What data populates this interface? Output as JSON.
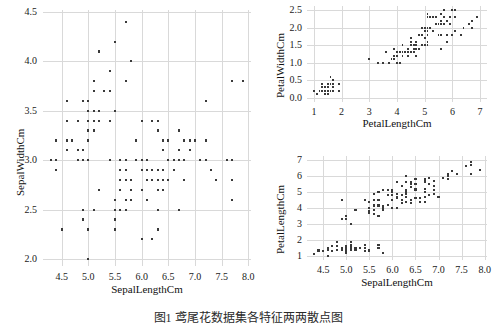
{
  "figure": {
    "caption": "图1 鸢尾花数据集各特征两两散点图",
    "marker_color": "#3a3a3a",
    "grid_color": "#d9d9d9",
    "background": "#ffffff"
  },
  "chart_data": [
    {
      "id": "sepal-width-vs-sepal-length",
      "type": "scatter",
      "title": "",
      "xlabel": "SepalLengthCm",
      "ylabel": "SepalWidthCm",
      "xlim": [
        4.15,
        8.05
      ],
      "ylim": [
        1.93,
        4.52
      ],
      "xticks": [
        "4.5",
        "5.0",
        "5.5",
        "6.0",
        "6.5",
        "7.0",
        "7.5",
        "8.0"
      ],
      "xtickvals": [
        4.5,
        5.0,
        5.5,
        6.0,
        6.5,
        7.0,
        7.5,
        8.0
      ],
      "yticks": [
        "2.0",
        "2.5",
        "3.0",
        "3.5",
        "4.0",
        "4.5"
      ],
      "ytickvals": [
        2.0,
        2.5,
        3.0,
        3.5,
        4.0,
        4.5
      ],
      "grid": true,
      "legend": "none",
      "x": [
        5.1,
        4.9,
        4.7,
        4.6,
        5.0,
        5.4,
        4.6,
        5.0,
        4.4,
        4.9,
        5.4,
        4.8,
        4.8,
        4.3,
        5.8,
        5.7,
        5.4,
        5.1,
        5.7,
        5.1,
        5.4,
        5.1,
        4.6,
        5.1,
        4.8,
        5.0,
        5.0,
        5.2,
        5.2,
        4.7,
        4.8,
        5.4,
        5.2,
        5.5,
        4.9,
        5.0,
        5.5,
        4.9,
        4.4,
        5.1,
        5.0,
        4.5,
        4.4,
        5.0,
        5.1,
        4.8,
        5.1,
        4.6,
        5.3,
        5.0,
        7.0,
        6.4,
        6.9,
        5.5,
        6.5,
        5.7,
        6.3,
        4.9,
        6.6,
        5.2,
        5.0,
        5.9,
        6.0,
        6.1,
        5.6,
        6.7,
        5.6,
        5.8,
        6.2,
        5.6,
        5.9,
        6.1,
        6.3,
        6.1,
        6.4,
        6.6,
        6.8,
        6.7,
        6.0,
        5.7,
        5.5,
        5.5,
        5.8,
        6.0,
        5.4,
        6.0,
        6.7,
        6.3,
        5.6,
        5.5,
        5.5,
        6.1,
        5.8,
        5.0,
        5.6,
        5.7,
        5.7,
        6.2,
        5.1,
        5.7,
        6.3,
        5.8,
        7.1,
        6.3,
        6.5,
        7.6,
        4.9,
        7.3,
        6.7,
        7.2,
        6.5,
        6.4,
        6.8,
        5.7,
        5.8,
        6.4,
        6.5,
        7.7,
        7.7,
        6.0,
        6.9,
        5.6,
        7.7,
        6.3,
        6.7,
        7.2,
        6.2,
        6.1,
        6.4,
        7.2,
        7.4,
        7.9,
        6.4,
        6.3,
        6.1,
        7.7,
        6.3,
        6.4,
        6.0,
        6.9,
        6.7,
        6.9,
        5.8,
        6.8,
        6.7,
        6.7,
        6.3,
        6.5,
        6.2,
        5.9
      ],
      "y": [
        3.5,
        3.0,
        3.2,
        3.1,
        3.6,
        3.9,
        3.4,
        3.4,
        2.9,
        3.1,
        3.7,
        3.4,
        3.0,
        3.0,
        4.0,
        4.4,
        3.9,
        3.5,
        3.8,
        3.8,
        3.4,
        3.7,
        3.6,
        3.3,
        3.4,
        3.0,
        3.4,
        3.5,
        3.4,
        3.2,
        3.1,
        3.4,
        4.1,
        4.2,
        3.1,
        3.2,
        3.5,
        3.6,
        3.0,
        3.4,
        3.5,
        2.3,
        3.2,
        3.5,
        3.8,
        3.0,
        3.8,
        3.2,
        3.7,
        3.3,
        3.2,
        3.2,
        3.1,
        2.3,
        2.8,
        2.8,
        3.3,
        2.4,
        2.9,
        2.7,
        2.0,
        3.0,
        2.2,
        2.9,
        2.9,
        3.1,
        3.0,
        2.7,
        2.2,
        2.5,
        3.2,
        2.8,
        2.5,
        2.8,
        2.9,
        3.0,
        2.8,
        3.0,
        2.9,
        2.6,
        2.4,
        2.4,
        2.7,
        2.7,
        3.0,
        3.4,
        3.1,
        2.3,
        3.0,
        2.5,
        2.6,
        3.0,
        2.6,
        2.3,
        2.7,
        3.0,
        2.9,
        2.9,
        2.5,
        2.8,
        3.3,
        2.7,
        3.0,
        2.9,
        3.0,
        3.0,
        2.5,
        2.9,
        2.5,
        3.6,
        3.2,
        2.7,
        3.0,
        2.5,
        2.8,
        3.2,
        3.0,
        3.8,
        2.6,
        2.2,
        3.2,
        2.8,
        2.8,
        2.7,
        3.3,
        3.2,
        2.8,
        3.0,
        2.8,
        3.0,
        2.8,
        3.8,
        2.8,
        2.8,
        2.6,
        3.0,
        3.4,
        3.1,
        3.0,
        3.1,
        3.1,
        3.1,
        2.7,
        3.2,
        3.3,
        3.0,
        2.5,
        3.0,
        3.4,
        3.0
      ]
    },
    {
      "id": "petal-width-vs-petal-length",
      "type": "scatter",
      "title": "",
      "xlabel": "PetalLengthCm",
      "ylabel": "PetalWidthCm",
      "xlim": [
        0.75,
        7.25
      ],
      "ylim": [
        -0.12,
        2.62
      ],
      "xticks": [
        "1",
        "2",
        "3",
        "4",
        "5",
        "6",
        "7"
      ],
      "xtickvals": [
        1,
        2,
        3,
        4,
        5,
        6,
        7
      ],
      "yticks": [
        "0.0",
        "0.5",
        "1.0",
        "1.5",
        "2.0",
        "2.5"
      ],
      "ytickvals": [
        0.0,
        0.5,
        1.0,
        1.5,
        2.0,
        2.5
      ],
      "grid": true,
      "legend": "none",
      "x": [
        1.4,
        1.4,
        1.3,
        1.5,
        1.4,
        1.7,
        1.4,
        1.5,
        1.4,
        1.5,
        1.5,
        1.6,
        1.4,
        1.1,
        1.2,
        1.5,
        1.3,
        1.4,
        1.7,
        1.5,
        1.7,
        1.5,
        1.0,
        1.7,
        1.9,
        1.6,
        1.6,
        1.5,
        1.4,
        1.6,
        1.6,
        1.5,
        1.5,
        1.4,
        1.5,
        1.2,
        1.3,
        1.4,
        1.3,
        1.5,
        1.3,
        1.3,
        1.3,
        1.6,
        1.9,
        1.4,
        1.6,
        1.4,
        1.5,
        1.4,
        4.7,
        4.5,
        4.9,
        4.0,
        4.6,
        4.5,
        4.7,
        3.3,
        4.6,
        3.9,
        3.5,
        4.2,
        4.0,
        4.7,
        3.6,
        4.4,
        4.5,
        4.1,
        4.5,
        3.9,
        4.8,
        4.0,
        4.9,
        4.7,
        4.3,
        4.4,
        4.8,
        5.0,
        4.5,
        3.5,
        3.8,
        3.7,
        3.9,
        5.1,
        4.5,
        4.5,
        4.7,
        4.4,
        4.1,
        4.0,
        4.4,
        4.6,
        4.0,
        3.3,
        4.2,
        4.2,
        4.2,
        4.3,
        3.0,
        4.1,
        6.0,
        5.1,
        5.9,
        5.6,
        5.8,
        6.6,
        4.5,
        6.3,
        5.8,
        6.1,
        5.1,
        5.3,
        5.5,
        5.0,
        5.1,
        5.3,
        5.5,
        6.7,
        6.9,
        5.0,
        5.7,
        4.9,
        6.7,
        4.9,
        5.7,
        6.0,
        4.8,
        4.9,
        5.6,
        5.8,
        6.1,
        6.4,
        5.6,
        5.1,
        5.6,
        6.1,
        5.6,
        5.5,
        4.8,
        5.4,
        5.6,
        5.1,
        5.1,
        5.9,
        5.7,
        5.2,
        5.0,
        5.2,
        5.4,
        5.1
      ],
      "y": [
        0.2,
        0.2,
        0.2,
        0.2,
        0.2,
        0.4,
        0.3,
        0.2,
        0.2,
        0.1,
        0.2,
        0.2,
        0.1,
        0.1,
        0.2,
        0.4,
        0.4,
        0.3,
        0.3,
        0.3,
        0.2,
        0.4,
        0.2,
        0.5,
        0.2,
        0.2,
        0.4,
        0.2,
        0.2,
        0.2,
        0.2,
        0.4,
        0.1,
        0.2,
        0.2,
        0.2,
        0.2,
        0.1,
        0.2,
        0.2,
        0.3,
        0.3,
        0.2,
        0.6,
        0.4,
        0.3,
        0.2,
        0.2,
        0.2,
        0.2,
        1.4,
        1.5,
        1.5,
        1.3,
        1.5,
        1.3,
        1.6,
        1.0,
        1.3,
        1.4,
        1.0,
        1.5,
        1.0,
        1.4,
        1.3,
        1.4,
        1.5,
        1.0,
        1.5,
        1.1,
        1.8,
        1.3,
        1.5,
        1.2,
        1.3,
        1.4,
        1.4,
        1.7,
        1.5,
        1.0,
        1.1,
        1.0,
        1.2,
        1.6,
        1.5,
        1.6,
        1.5,
        1.3,
        1.3,
        1.3,
        1.2,
        1.4,
        1.2,
        1.0,
        1.3,
        1.2,
        1.3,
        1.3,
        1.1,
        1.3,
        2.5,
        1.9,
        2.1,
        1.8,
        2.2,
        2.1,
        1.7,
        1.8,
        1.8,
        2.5,
        2.0,
        1.9,
        2.1,
        2.0,
        2.4,
        2.3,
        1.8,
        2.2,
        2.3,
        1.5,
        2.3,
        2.0,
        2.0,
        1.8,
        2.1,
        1.8,
        1.8,
        1.8,
        2.1,
        1.6,
        1.9,
        2.0,
        2.2,
        1.5,
        1.4,
        2.3,
        2.4,
        1.8,
        1.8,
        2.1,
        2.4,
        2.3,
        1.9,
        2.3,
        2.5,
        2.3,
        1.9,
        2.0,
        2.3,
        1.8
      ]
    },
    {
      "id": "petal-length-vs-sepal-length",
      "type": "scatter",
      "title": "",
      "xlabel": "SepalLengthCm",
      "ylabel": "PetalLengthCm",
      "xlim": [
        4.15,
        8.05
      ],
      "ylim": [
        0.75,
        7.25
      ],
      "xticks": [
        "4.5",
        "5.0",
        "5.5",
        "6.0",
        "6.5",
        "7.0",
        "7.5",
        "8.0"
      ],
      "xtickvals": [
        4.5,
        5.0,
        5.5,
        6.0,
        6.5,
        7.0,
        7.5,
        8.0
      ],
      "yticks": [
        "1",
        "2",
        "3",
        "4",
        "5",
        "6",
        "7"
      ],
      "ytickvals": [
        1,
        2,
        3,
        4,
        5,
        6,
        7
      ],
      "grid": true,
      "legend": "none",
      "x": [
        5.1,
        4.9,
        4.7,
        4.6,
        5.0,
        5.4,
        4.6,
        5.0,
        4.4,
        4.9,
        5.4,
        4.8,
        4.8,
        4.3,
        5.8,
        5.7,
        5.4,
        5.1,
        5.7,
        5.1,
        5.4,
        5.1,
        4.6,
        5.1,
        4.8,
        5.0,
        5.0,
        5.2,
        5.2,
        4.7,
        4.8,
        5.4,
        5.2,
        5.5,
        4.9,
        5.0,
        5.5,
        4.9,
        4.4,
        5.1,
        5.0,
        4.5,
        4.4,
        5.0,
        5.1,
        4.8,
        5.1,
        4.6,
        5.3,
        5.0,
        7.0,
        6.4,
        6.9,
        5.5,
        6.5,
        5.7,
        6.3,
        4.9,
        6.6,
        5.2,
        5.0,
        5.9,
        6.0,
        6.1,
        5.6,
        6.7,
        5.6,
        5.8,
        6.2,
        5.6,
        5.9,
        6.1,
        6.3,
        6.1,
        6.4,
        6.6,
        6.8,
        6.7,
        6.0,
        5.7,
        5.5,
        5.5,
        5.8,
        6.0,
        5.4,
        6.0,
        6.7,
        6.3,
        5.6,
        5.5,
        5.5,
        6.1,
        5.8,
        5.0,
        5.6,
        5.7,
        5.7,
        6.2,
        5.1,
        5.7,
        6.3,
        5.8,
        7.1,
        6.3,
        6.5,
        7.6,
        4.9,
        7.3,
        6.7,
        7.2,
        6.5,
        6.4,
        6.8,
        5.7,
        5.8,
        6.4,
        6.5,
        7.7,
        7.7,
        6.0,
        6.9,
        5.6,
        7.7,
        6.3,
        6.7,
        7.2,
        6.2,
        6.1,
        6.4,
        7.2,
        7.4,
        7.9,
        6.4,
        6.3,
        6.1,
        7.7,
        6.3,
        6.4,
        6.0,
        6.9,
        6.7,
        6.9,
        5.8,
        6.8,
        6.7,
        6.7,
        6.3,
        6.5,
        6.2,
        5.9
      ],
      "y": [
        1.4,
        1.4,
        1.3,
        1.5,
        1.4,
        1.7,
        1.4,
        1.5,
        1.4,
        1.5,
        1.5,
        1.6,
        1.4,
        1.1,
        1.2,
        1.5,
        1.3,
        1.4,
        1.7,
        1.5,
        1.7,
        1.5,
        1.0,
        1.7,
        1.9,
        1.6,
        1.6,
        1.5,
        1.4,
        1.6,
        1.6,
        1.5,
        1.5,
        1.4,
        1.5,
        1.2,
        1.3,
        1.4,
        1.3,
        1.5,
        1.3,
        1.3,
        1.3,
        1.6,
        1.9,
        1.4,
        1.6,
        1.4,
        1.5,
        1.4,
        4.7,
        4.5,
        4.9,
        4.0,
        4.6,
        4.5,
        4.7,
        3.3,
        4.6,
        3.9,
        3.5,
        4.2,
        4.0,
        4.7,
        3.6,
        4.4,
        4.5,
        4.1,
        4.5,
        3.9,
        4.8,
        4.0,
        4.9,
        4.7,
        4.3,
        4.4,
        4.8,
        5.0,
        4.5,
        3.5,
        3.8,
        3.7,
        3.9,
        5.1,
        4.5,
        4.5,
        4.7,
        4.4,
        4.1,
        4.0,
        4.4,
        4.6,
        4.0,
        3.3,
        4.2,
        4.2,
        4.2,
        4.3,
        3.0,
        4.1,
        6.0,
        5.1,
        5.9,
        5.6,
        5.8,
        6.6,
        4.5,
        6.3,
        5.8,
        6.1,
        5.1,
        5.3,
        5.5,
        5.0,
        5.1,
        5.3,
        5.5,
        6.7,
        6.9,
        5.0,
        5.7,
        4.9,
        6.7,
        4.9,
        5.7,
        6.0,
        4.8,
        4.9,
        5.6,
        5.8,
        6.1,
        6.4,
        5.6,
        5.1,
        5.6,
        6.1,
        5.6,
        5.5,
        4.8,
        5.4,
        5.6,
        5.1,
        5.1,
        5.9,
        5.7,
        5.2,
        5.0,
        5.2,
        5.4,
        5.1
      ]
    }
  ]
}
